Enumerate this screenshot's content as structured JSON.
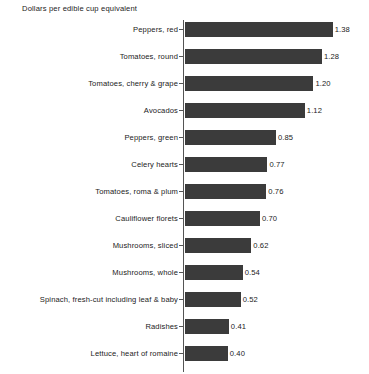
{
  "chart_data": {
    "type": "bar",
    "orientation": "horizontal",
    "title": "Dollars per edible cup equivalent",
    "xlabel": "",
    "ylabel": "",
    "grid": false,
    "legend": null,
    "xlim": [
      0,
      1.45
    ],
    "axis_line": "left",
    "bar_color": "#3b3b3b",
    "background_color": "#ffffff",
    "value_label_format": "2 decimals",
    "categories": [
      "Peppers, red",
      "Tomatoes, round",
      "Tomatoes, cherry & grape",
      "Avocados",
      "Peppers, green",
      "Celery hearts",
      "Tomatoes, roma & plum",
      "Cauliflower florets",
      "Mushrooms, sliced",
      "Mushrooms, whole",
      "Spinach, fresh-cut including leaf & baby",
      "Radishes",
      "Lettuce, heart of romaine"
    ],
    "values": [
      1.38,
      1.28,
      1.2,
      1.12,
      0.85,
      0.77,
      0.76,
      0.7,
      0.62,
      0.54,
      0.52,
      0.41,
      0.4
    ],
    "value_labels": [
      "1.38",
      "1.28",
      "1.20",
      "1.12",
      "0.85",
      "0.77",
      "0.76",
      "0.70",
      "0.62",
      "0.54",
      "0.52",
      "0.41",
      "0.40"
    ],
    "bars": [
      {
        "label": "Peppers, red",
        "value": 1.38,
        "value_label": "1.38"
      },
      {
        "label": "Tomatoes, round",
        "value": 1.28,
        "value_label": "1.28"
      },
      {
        "label": "Tomatoes, cherry & grape",
        "value": 1.2,
        "value_label": "1.20"
      },
      {
        "label": "Avocados",
        "value": 1.12,
        "value_label": "1.12"
      },
      {
        "label": "Peppers, green",
        "value": 0.85,
        "value_label": "0.85"
      },
      {
        "label": "Celery hearts",
        "value": 0.77,
        "value_label": "0.77"
      },
      {
        "label": "Tomatoes, roma & plum",
        "value": 0.76,
        "value_label": "0.76"
      },
      {
        "label": "Cauliflower florets",
        "value": 0.7,
        "value_label": "0.70"
      },
      {
        "label": "Mushrooms, sliced",
        "value": 0.62,
        "value_label": "0.62"
      },
      {
        "label": "Mushrooms, whole",
        "value": 0.54,
        "value_label": "0.54"
      },
      {
        "label": "Spinach, fresh-cut including leaf & baby",
        "value": 0.52,
        "value_label": "0.52"
      },
      {
        "label": "Radishes",
        "value": 0.41,
        "value_label": "0.41"
      },
      {
        "label": "Lettuce, heart of romaine",
        "value": 0.4,
        "value_label": "0.40"
      }
    ]
  },
  "layout": {
    "px_per_unit": 107,
    "bar_origin_x": 185,
    "row_pitch": 27,
    "bar_height": 15,
    "plot_top": 4
  }
}
